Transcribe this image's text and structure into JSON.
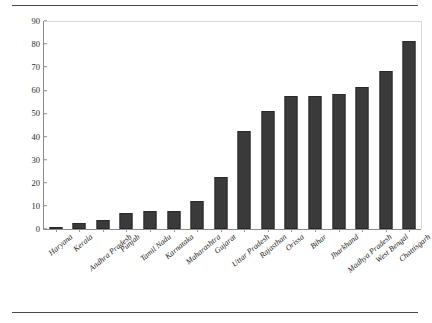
{
  "document": {
    "has_top_rule": true,
    "has_bottom_rule": true,
    "rule_color": "#4a4a4a"
  },
  "chart_data": {
    "type": "bar",
    "title": "",
    "subtitle": "",
    "xlabel": "",
    "ylabel": "",
    "ylim": [
      0,
      90
    ],
    "ytick_step": 10,
    "ytick_labels": [
      "0",
      "10",
      "20",
      "30",
      "40",
      "50",
      "60",
      "70",
      "80",
      "90"
    ],
    "grid": false,
    "legend": null,
    "bar_color": "#3a3a3a",
    "axis_color": "#8b8b8b",
    "categories": [
      "Haryana",
      "Kerala",
      "Andhra Pradesh",
      "Punjab",
      "Tamil Nadu",
      "Karnataka",
      "Maharashtra",
      "Gujarat",
      "Uttar Pradesh",
      "Rajasthan",
      "Orissa",
      "Bihar",
      "Jharkhand",
      "Madhya Pradesh",
      "West Bengal",
      "Chattisgarh"
    ],
    "values": [
      0.3,
      2.8,
      4,
      7,
      8,
      8,
      12,
      22.5,
      42.5,
      51,
      57.5,
      57.5,
      58.5,
      61.5,
      68.5,
      81.5
    ]
  }
}
